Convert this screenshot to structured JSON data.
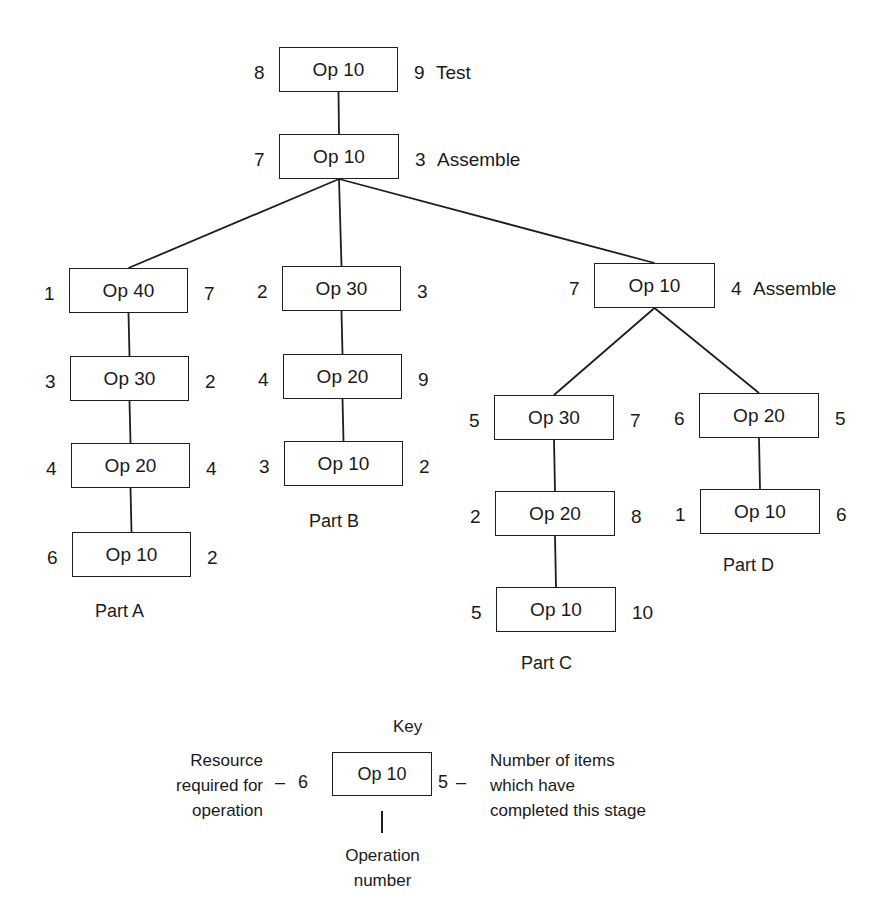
{
  "diagram": {
    "nodes": [
      {
        "id": "top-test",
        "op": "Op 10",
        "resource": "8",
        "completed": "9",
        "note": "Test",
        "x": 279,
        "y": 47,
        "w": 119,
        "h": 45
      },
      {
        "id": "top-assemble",
        "op": "Op 10",
        "resource": "7",
        "completed": "3",
        "note": "Assemble",
        "x": 279,
        "y": 134,
        "w": 120,
        "h": 45
      },
      {
        "id": "a-op40",
        "op": "Op 40",
        "resource": "1",
        "completed": "7",
        "note": "",
        "x": 69,
        "y": 268,
        "w": 119,
        "h": 45
      },
      {
        "id": "a-op30",
        "op": "Op 30",
        "resource": "3",
        "completed": "2",
        "note": "",
        "x": 70,
        "y": 356,
        "w": 119,
        "h": 45
      },
      {
        "id": "a-op20",
        "op": "Op 20",
        "resource": "4",
        "completed": "4",
        "note": "",
        "x": 71,
        "y": 443,
        "w": 119,
        "h": 45
      },
      {
        "id": "a-op10",
        "op": "Op 10",
        "resource": "6",
        "completed": "2",
        "note": "",
        "x": 72,
        "y": 532,
        "w": 119,
        "h": 45
      },
      {
        "id": "b-op30",
        "op": "Op 30",
        "resource": "2",
        "completed": "3",
        "note": "",
        "x": 282,
        "y": 266,
        "w": 119,
        "h": 45
      },
      {
        "id": "b-op20",
        "op": "Op 20",
        "resource": "4",
        "completed": "9",
        "note": "",
        "x": 283,
        "y": 354,
        "w": 119,
        "h": 45
      },
      {
        "id": "b-op10",
        "op": "Op 10",
        "resource": "3",
        "completed": "2",
        "note": "",
        "x": 284,
        "y": 441,
        "w": 119,
        "h": 45
      },
      {
        "id": "cd-assemble",
        "op": "Op 10",
        "resource": "7",
        "completed": "4",
        "note": "Assemble",
        "x": 594,
        "y": 263,
        "w": 121,
        "h": 45
      },
      {
        "id": "c-op30",
        "op": "Op 30",
        "resource": "5",
        "completed": "7",
        "note": "",
        "x": 494,
        "y": 395,
        "w": 120,
        "h": 45
      },
      {
        "id": "c-op20",
        "op": "Op 20",
        "resource": "2",
        "completed": "8",
        "note": "",
        "x": 495,
        "y": 491,
        "w": 120,
        "h": 45
      },
      {
        "id": "c-op10",
        "op": "Op 10",
        "resource": "5",
        "completed": "10",
        "note": "",
        "x": 496,
        "y": 587,
        "w": 120,
        "h": 45
      },
      {
        "id": "d-op20",
        "op": "Op 20",
        "resource": "6",
        "completed": "5",
        "note": "",
        "x": 699,
        "y": 393,
        "w": 120,
        "h": 45
      },
      {
        "id": "d-op10",
        "op": "Op 10",
        "resource": "1",
        "completed": "6",
        "note": "",
        "x": 700,
        "y": 489,
        "w": 120,
        "h": 45
      }
    ],
    "edges": [
      {
        "from": "top-test",
        "to": "top-assemble"
      },
      {
        "from": "top-assemble",
        "to": "a-op40"
      },
      {
        "from": "top-assemble",
        "to": "b-op30"
      },
      {
        "from": "top-assemble",
        "to": "cd-assemble"
      },
      {
        "from": "a-op40",
        "to": "a-op30"
      },
      {
        "from": "a-op30",
        "to": "a-op20"
      },
      {
        "from": "a-op20",
        "to": "a-op10"
      },
      {
        "from": "b-op30",
        "to": "b-op20"
      },
      {
        "from": "b-op20",
        "to": "b-op10"
      },
      {
        "from": "cd-assemble",
        "to": "c-op30"
      },
      {
        "from": "cd-assemble",
        "to": "d-op20"
      },
      {
        "from": "c-op30",
        "to": "c-op20"
      },
      {
        "from": "c-op20",
        "to": "c-op10"
      },
      {
        "from": "d-op20",
        "to": "d-op10"
      }
    ],
    "parts": [
      {
        "label": "Part A",
        "x": 95,
        "y": 602
      },
      {
        "label": "Part B",
        "x": 309,
        "y": 512
      },
      {
        "label": "Part C",
        "x": 521,
        "y": 654
      },
      {
        "label": "Part D",
        "x": 723,
        "y": 556
      }
    ]
  },
  "key": {
    "title": "Key",
    "op": "Op 10",
    "resource": "6",
    "completed": "5",
    "left_dash": "–",
    "right_dash": "–",
    "resource_label": [
      "Resource",
      "required for",
      "operation"
    ],
    "completed_label": [
      "Number of items",
      "which have",
      "completed this stage"
    ],
    "operation_label": [
      "Operation",
      "number"
    ]
  }
}
